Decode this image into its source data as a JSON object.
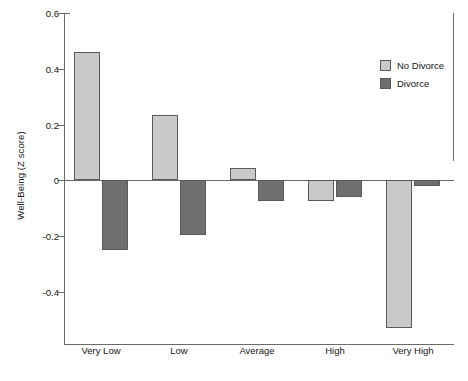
{
  "chart_data": {
    "type": "bar",
    "title": "",
    "subtitle": "",
    "xlabel": "",
    "ylabel": "Well-Being (Z score)",
    "categories": [
      "Very Low",
      "Low",
      "Average",
      "High",
      "Very High"
    ],
    "series": [
      {
        "name": "No Divorce",
        "color": "#c9c9c9",
        "values": [
          0.46,
          0.235,
          0.045,
          -0.075,
          -0.53
        ]
      },
      {
        "name": "Divorce",
        "color": "#6f6f6f",
        "values": [
          -0.25,
          -0.195,
          -0.075,
          -0.06,
          -0.02
        ]
      }
    ],
    "ylim": [
      -0.59,
      0.6
    ],
    "yticks": [
      0.6,
      0.4,
      0.2,
      0,
      -0.2,
      -0.4
    ],
    "yticklabels": [
      "0.6",
      "0.4",
      "0.2",
      "0",
      "-0.2",
      "-0.4"
    ],
    "grid": false,
    "legend_position": "upper right",
    "annotations": []
  },
  "legend": {
    "entries": [
      {
        "label": "No Divorce"
      },
      {
        "label": "Divorce"
      }
    ]
  }
}
